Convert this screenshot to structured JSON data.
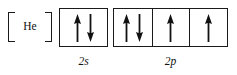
{
  "diagram": {
    "core": {
      "label": "He",
      "bracket_open": "[",
      "bracket_close": "]"
    },
    "subshells": [
      {
        "label": "2s",
        "name": "2s",
        "box_count": 1,
        "boxes": [
          {
            "spins": [
              "up",
              "down"
            ]
          }
        ]
      },
      {
        "label": "2p",
        "name": "2p",
        "box_count": 3,
        "boxes": [
          {
            "spins": [
              "up",
              "down"
            ]
          },
          {
            "spins": [
              "up"
            ]
          },
          {
            "spins": [
              "up"
            ]
          }
        ]
      }
    ],
    "colors": {
      "ink": "#1a1a1a",
      "background": "#ffffff"
    }
  }
}
